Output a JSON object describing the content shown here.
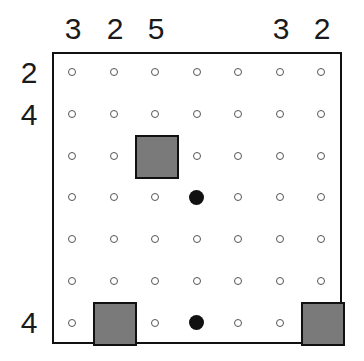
{
  "puzzle": {
    "rows": 7,
    "cols": 7,
    "column_clues": [
      "3",
      "2",
      "5",
      "",
      "",
      "3",
      "2"
    ],
    "row_clues": [
      "2",
      "4",
      "",
      "",
      "",
      "",
      "4"
    ],
    "colors": {
      "block": "#7a7a7a",
      "border": "#111111",
      "bulb": "#111111",
      "dot": "#555555"
    },
    "blocks": [
      {
        "row": 2,
        "col": 2
      },
      {
        "row": 6,
        "col": 1
      },
      {
        "row": 6,
        "col": 6
      }
    ],
    "bulbs": [
      {
        "row": 3,
        "col": 3
      },
      {
        "row": 6,
        "col": 3
      }
    ]
  }
}
